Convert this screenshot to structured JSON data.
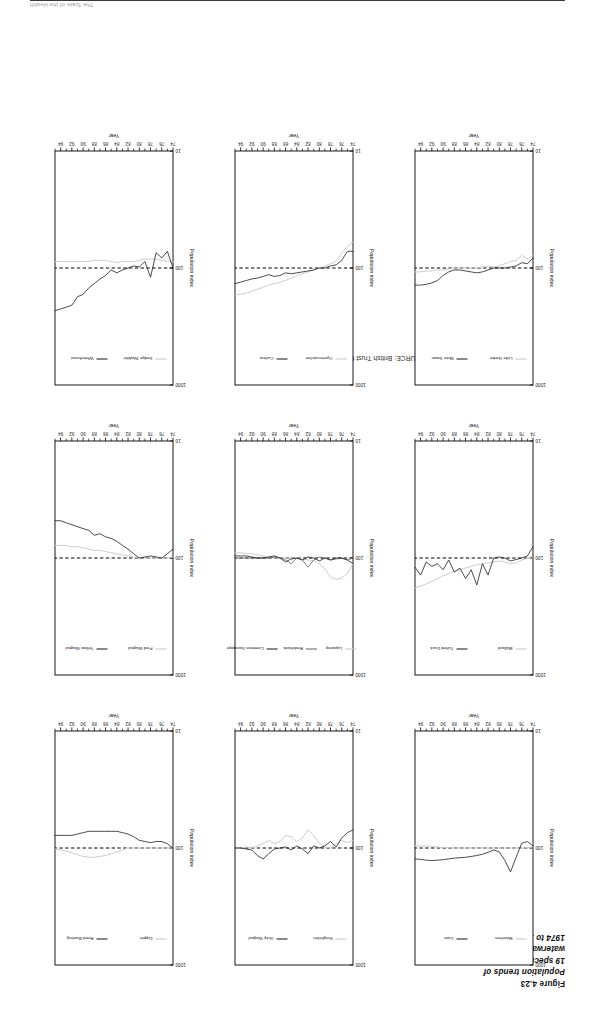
{
  "running_head": {
    "text": "The State of the Health"
  },
  "caption": {
    "figure_number": "Figure 4.23",
    "line1": "Population trends of",
    "line2": "19 species of",
    "line3": "waterways birds,",
    "line4": "1974 to 1995"
  },
  "source": {
    "text": "SOURCE: British Trust for Ornithology"
  },
  "axes": {
    "xlabel": "Year",
    "ylabel": "Population index",
    "ytick_labels": [
      "1000",
      "100",
      "10"
    ],
    "xtick_labels": [
      "74",
      "76",
      "78",
      "80",
      "82",
      "84",
      "86",
      "88",
      "90",
      "92",
      "94"
    ]
  },
  "chart_data": {
    "type": "line",
    "title": "Population trends of 19 species of waterways birds, 1974 to 1995",
    "xlabel": "Year",
    "ylabel": "Population index",
    "x": [
      74,
      75,
      76,
      77,
      78,
      79,
      80,
      81,
      82,
      83,
      84,
      85,
      86,
      87,
      88,
      89,
      90,
      91,
      92,
      93,
      94,
      95
    ],
    "xlim": [
      74,
      95
    ],
    "ylim": [
      10,
      1000
    ],
    "yscale": "log",
    "yticks": [
      10,
      100,
      1000
    ],
    "reference_line": 100,
    "grid": false,
    "legend_position": "inside-top",
    "panels": [
      {
        "id": "panel-moorhen-coot",
        "row": 1,
        "col": 1,
        "series": [
          {
            "name": "Moorhen",
            "color": "#c9c9c9",
            "values": [
              100,
              99,
              101,
              100,
              100,
              100,
              100,
              100,
              100,
              100,
              100,
              100,
              100,
              100,
              100,
              99,
              99,
              98,
              97,
              96,
              96,
              96
            ]
          },
          {
            "name": "Coot",
            "color": "#2b2b2b",
            "values": [
              96,
              88,
              91,
              120,
              160,
              128,
              108,
              104,
              109,
              113,
              116,
              118,
              120,
              121,
              122,
              124,
              126,
              127,
              128,
              127,
              125,
              124
            ]
          }
        ]
      },
      {
        "id": "panel-mallard-tufted-duck",
        "row": 2,
        "col": 1,
        "series": [
          {
            "name": "Mallard",
            "color": "#c9c9c9",
            "values": [
              100,
              101,
              104,
              110,
              112,
              108,
              106,
              108,
              110,
              112,
              114,
              118,
              122,
              126,
              130,
              136,
              142,
              150,
              158,
              166,
              174,
              180
            ]
          },
          {
            "name": "Tufted Duck",
            "color": "#2b2b2b",
            "values": [
              80,
              96,
              100,
              103,
              106,
              100,
              98,
              100,
              140,
              112,
              170,
              126,
              150,
              122,
              132,
              104,
              126,
              112,
              118,
              108,
              140,
              120
            ]
          }
        ]
      },
      {
        "id": "panel-little-grebe-mute-swan",
        "row": 3,
        "col": 1,
        "series": [
          {
            "name": "Little Grebe",
            "color": "#c9c9c9",
            "values": [
              78,
              84,
              78,
              86,
              88,
              92,
              96,
              98,
              96,
              98,
              100,
              100,
              100,
              100,
              100,
              102,
              104,
              104,
              106,
              106,
              108,
              108
            ]
          },
          {
            "name": "Mute Swan",
            "color": "#2b2b2b",
            "values": [
              82,
              92,
              90,
              96,
              98,
              100,
              100,
              100,
              104,
              108,
              110,
              108,
              106,
              104,
              104,
              108,
              116,
              128,
              134,
              138,
              140,
              140
            ]
          }
        ]
      },
      {
        "id": "panel-kingfisher-grey-wagtail",
        "row": 1,
        "col": 2,
        "series": [
          {
            "name": "Kingfisher",
            "color": "#c9c9c9",
            "values": [
              86,
              90,
              86,
              92,
              100,
              98,
              92,
              78,
              70,
              82,
              88,
              80,
              78,
              88,
              92,
              86,
              92,
              96,
              100,
              98,
              100,
              100
            ]
          },
          {
            "name": "Grey Wagtail",
            "color": "#2b2b2b",
            "values": [
              70,
              74,
              82,
              98,
              88,
              96,
              100,
              96,
              112,
              102,
              96,
              104,
              98,
              100,
              102,
              112,
              124,
              116,
              104,
              102,
              100,
              100
            ]
          }
        ]
      },
      {
        "id": "panel-lapwing-redshank-common-sandpiper",
        "row": 2,
        "col": 2,
        "series": [
          {
            "name": "Lapwing",
            "color": "#c9c9c9",
            "values": [
              112,
              136,
              148,
              152,
              146,
              124,
              112,
              106,
              104,
              102,
              100,
              100,
              100,
              100,
              100,
              98,
              96,
              94,
              92,
              92,
              90,
              90
            ]
          },
          {
            "name": "Redshank",
            "color": "#6e6e6e",
            "values": [
              100,
              104,
              100,
              102,
              104,
              100,
              98,
              104,
              120,
              104,
              100,
              112,
              104,
              100,
              98,
              100,
              100,
              100,
              100,
              100,
              100,
              100
            ]
          },
          {
            "name": "Common Sandpiper",
            "color": "#2b2b2b",
            "values": [
              112,
              104,
              100,
              100,
              104,
              100,
              106,
              100,
              98,
              104,
              100,
              102,
              108,
              100,
              96,
              98,
              100,
              100,
              98,
              96,
              96,
              96
            ]
          }
        ]
      },
      {
        "id": "panel-oystercatcher-curlew",
        "row": 3,
        "col": 2,
        "series": [
          {
            "name": "Oystercatcher",
            "color": "#c9c9c9",
            "values": [
              60,
              66,
              74,
              88,
              92,
              96,
              100,
              104,
              108,
              112,
              116,
              122,
              128,
              132,
              136,
              140,
              146,
              152,
              158,
              164,
              168,
              170
            ]
          },
          {
            "name": "Curlew",
            "color": "#2b2b2b",
            "values": [
              72,
              72,
              86,
              94,
              96,
              100,
              100,
              104,
              106,
              108,
              110,
              112,
              110,
              116,
              118,
              114,
              118,
              122,
              124,
              128,
              132,
              136
            ]
          }
        ]
      },
      {
        "id": "panel-dipper-reed-bunting",
        "row": 1,
        "col": 3,
        "series": [
          {
            "name": "Dipper",
            "color": "#c9c9c9",
            "values": [
              100,
              100,
              100,
              100,
              100,
              100,
              100,
              100,
              100,
              104,
              108,
              112,
              116,
              118,
              120,
              120,
              118,
              114,
              110,
              106,
              104,
              102
            ]
          },
          {
            "name": "Reed Bunting",
            "color": "#2b2b2b",
            "values": [
              100,
              92,
              88,
              88,
              90,
              88,
              86,
              80,
              76,
              74,
              72,
              72,
              72,
              72,
              72,
              72,
              74,
              76,
              78,
              78,
              78,
              78
            ]
          }
        ]
      },
      {
        "id": "panel-pied-wagtail-yellow-wagtail",
        "row": 2,
        "col": 3,
        "series": [
          {
            "name": "Pied Wagtail",
            "color": "#c9c9c9",
            "values": [
              98,
              100,
              100,
              100,
              100,
              100,
              100,
              98,
              96,
              94,
              92,
              90,
              88,
              86,
              86,
              84,
              82,
              80,
              80,
              78,
              78,
              78
            ]
          },
          {
            "name": "Yellow Wagtail",
            "color": "#2b2b2b",
            "values": [
              84,
              92,
              100,
              98,
              96,
              98,
              100,
              92,
              84,
              78,
              72,
              68,
              66,
              62,
              64,
              58,
              56,
              54,
              52,
              50,
              48,
              48
            ]
          }
        ]
      },
      {
        "id": "panel-sedge-warbler-whitethroat",
        "row": 3,
        "col": 3,
        "series": [
          {
            "name": "Sedge Warbler",
            "color": "#c9c9c9",
            "values": [
              88,
              88,
              86,
              84,
              84,
              84,
              86,
              88,
              88,
              88,
              90,
              88,
              86,
              86,
              86,
              88,
              88,
              88,
              88,
              88,
              88,
              88
            ]
          },
          {
            "name": "Whitethroat",
            "color": "#2b2b2b",
            "values": [
              100,
              72,
              82,
              74,
              120,
              88,
              98,
              96,
              100,
              104,
              110,
              104,
              116,
              124,
              136,
              148,
              168,
              176,
              208,
              216,
              224,
              232
            ]
          }
        ]
      }
    ]
  }
}
